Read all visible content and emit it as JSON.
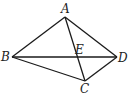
{
  "diagram": {
    "points": {
      "A": {
        "label": "A",
        "x": 65,
        "y": 17,
        "lx": 61,
        "ly": 13
      },
      "B": {
        "label": "B",
        "x": 12,
        "y": 57,
        "lx": 1,
        "ly": 61
      },
      "C": {
        "label": "C",
        "x": 85,
        "y": 81,
        "lx": 80,
        "ly": 93
      },
      "D": {
        "label": "D",
        "x": 117,
        "y": 57,
        "lx": 118,
        "ly": 62
      },
      "E": {
        "label": "E",
        "x": 78,
        "y": 57,
        "lx": 75,
        "ly": 54
      }
    },
    "segments": [
      [
        "A",
        "B"
      ],
      [
        "A",
        "D"
      ],
      [
        "B",
        "D"
      ],
      [
        "B",
        "C"
      ],
      [
        "C",
        "D"
      ],
      [
        "A",
        "C"
      ]
    ]
  }
}
